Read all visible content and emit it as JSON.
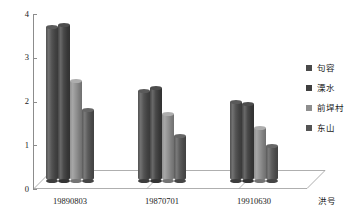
{
  "chart_data": {
    "type": "bar",
    "title": "",
    "subtitle": "",
    "xlabel": "洪号",
    "ylabel": "百分比/%",
    "ylim": [
      0,
      4
    ],
    "yticks": [
      0,
      1,
      2,
      3,
      4
    ],
    "grid": false,
    "legend_position": "right",
    "style": "3d-cylinder-bars",
    "categories": [
      "19890803",
      "19870701",
      "19910630"
    ],
    "series": [
      {
        "name": "句容",
        "values": [
          3.7,
          2.15,
          1.9
        ],
        "color": "#4a4a4a"
      },
      {
        "name": "溧水",
        "values": [
          3.73,
          2.22,
          1.85
        ],
        "color": "#3f3f3f"
      },
      {
        "name": "前垾村",
        "values": [
          2.4,
          1.6,
          1.27
        ],
        "color": "#8e8e8e"
      },
      {
        "name": "东山",
        "values": [
          1.7,
          1.07,
          0.85
        ],
        "color": "#545454"
      }
    ]
  },
  "axis": {
    "y_title": "百分比/%",
    "x_title": "洪号",
    "y_tick_labels": [
      "0",
      "1",
      "2",
      "3",
      "4"
    ],
    "x_tick_labels": [
      "19890803",
      "19870701",
      "19910630"
    ]
  },
  "legend": {
    "items": [
      {
        "label": "句容",
        "color": "#4a4a4a"
      },
      {
        "label": "溧水",
        "color": "#3f3f3f"
      },
      {
        "label": "前垾村",
        "color": "#8e8e8e"
      },
      {
        "label": "东山",
        "color": "#545454"
      }
    ]
  },
  "colors": {
    "axis": "#8c8c8c",
    "floor": "#9a9a9a",
    "text": "#1a1a1a",
    "background": "#ffffff"
  }
}
